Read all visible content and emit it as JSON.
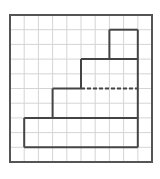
{
  "diagram": {
    "grid": {
      "columns": 10,
      "rows": 10,
      "origin_x": 10,
      "origin_y": 15,
      "cell_w": 14.2,
      "cell_h": 14.7,
      "grid_color": "#d4d4d4",
      "border_color": "#555555"
    },
    "shapes": [
      {
        "name": "bottom-block",
        "col0": 1,
        "row0": 7,
        "col1": 9,
        "row1": 9
      },
      {
        "name": "second-block",
        "col0": 3,
        "row0": 5,
        "col1": 9,
        "row1": 7
      },
      {
        "name": "third-block",
        "col0": 5,
        "row0": 3,
        "col1": 9,
        "row1": 5
      },
      {
        "name": "top-block",
        "col0": 7,
        "row0": 1,
        "col1": 9,
        "row1": 3
      }
    ],
    "dashed_segment": {
      "col0": 5,
      "col1": 9,
      "row": 5
    },
    "stroke_color": "#444444"
  }
}
